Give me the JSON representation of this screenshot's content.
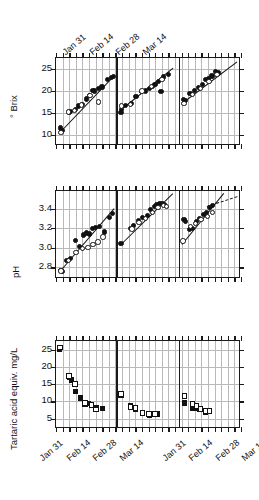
{
  "figure": {
    "width": 259,
    "height": 500,
    "background": "#ffffff",
    "axis_color": "#1a1a1a",
    "grid_color": "#b9b9b9",
    "marker_color": "#111111"
  },
  "chart_data": [
    {
      "id": "brix",
      "type": "scatter",
      "title": "",
      "ylabel": "° Brix",
      "xlabel": "",
      "ylim": [
        7.5,
        27.5
      ],
      "yticks": [
        10,
        15,
        20,
        25
      ],
      "yticklabels": [
        "10",
        "15",
        "20",
        "25"
      ],
      "grid": true,
      "legend": "",
      "xaxis_labels_position": "top",
      "xticklabels": [
        "Jan 31",
        "Feb 14",
        "Feb 28",
        "Mar 14"
      ],
      "xtick_label_values": [
        31,
        45,
        59,
        73
      ],
      "xlim": [
        24,
        122
      ],
      "panels": [
        {
          "name": "panel-1",
          "xrange": [
            24,
            56
          ],
          "trendline": {
            "x1": 26,
            "y1": 10.6,
            "x2": 55,
            "y2": 23.6,
            "style": "solid"
          },
          "series": [
            {
              "name": "filled-circle",
              "marker": "filled-circle",
              "x": [
                26.4,
                27.2,
                31.0,
                31.8,
                34.4,
                36.0,
                38.0,
                40.2,
                41.6,
                43.6,
                44.6,
                46.6,
                48.4,
                51.4,
                53.4,
                54.6
              ],
              "y": [
                11.6,
                11.0,
                15.1,
                15.4,
                15.8,
                16.6,
                17.0,
                18.2,
                18.9,
                20.2,
                20.0,
                20.6,
                20.9,
                22.6,
                23.0,
                23.3
              ]
            },
            {
              "name": "open-circle",
              "marker": "open-circle",
              "x": [
                26.6,
                30.6,
                33.8,
                37.6,
                42.0,
                46.6
              ],
              "y": [
                10.6,
                15.2,
                15.6,
                16.8,
                19.0,
                17.5
              ]
            }
          ]
        },
        {
          "name": "panel-2",
          "xrange": [
            56,
            89
          ],
          "trendline": {
            "x1": 58,
            "y1": 15.6,
            "x2": 86,
            "y2": 25.2,
            "style": "solid"
          },
          "series": [
            {
              "name": "filled-circle",
              "marker": "filled-circle",
              "x": [
                58.4,
                58.8,
                61.0,
                64.0,
                66.4,
                69.2,
                71.4,
                73.4,
                75.0,
                76.4,
                78.2,
                79.6,
                81.0,
                83.4
              ],
              "y": [
                15.2,
                15.8,
                16.7,
                17.2,
                18.8,
                19.8,
                20.0,
                20.6,
                21.1,
                21.5,
                22.1,
                19.8,
                23.2,
                23.8
              ]
            },
            {
              "name": "open-circle",
              "marker": "open-circle",
              "x": [
                58.6,
                63.6,
                69.6,
                74.6,
                80.2
              ],
              "y": [
                16.6,
                17.0,
                20.0,
                21.0,
                22.6
              ]
            }
          ]
        },
        {
          "name": "panel-3",
          "xrange": [
            89,
            122
          ],
          "trendline": {
            "x1": 91,
            "y1": 17.2,
            "x2": 120,
            "y2": 26.6,
            "style": "solid"
          },
          "series": [
            {
              "name": "filled-circle",
              "marker": "filled-circle",
              "x": [
                91.4,
                92.6,
                95.0,
                97.2,
                99.4,
                101.4,
                103.0,
                104.8,
                106.6,
                108.4,
                110.0
              ],
              "y": [
                18.0,
                17.9,
                19.4,
                20.2,
                20.8,
                21.5,
                22.6,
                22.8,
                23.4,
                24.4,
                24.1
              ]
            },
            {
              "name": "open-circle",
              "marker": "open-circle",
              "x": [
                91.8,
                96.4,
                100.6,
                105.0,
                109.2
              ],
              "y": [
                17.2,
                19.2,
                20.6,
                22.2,
                23.8
              ]
            }
          ]
        }
      ]
    },
    {
      "id": "ph",
      "type": "scatter",
      "title": "",
      "ylabel": "pH",
      "xlabel": "",
      "ylim": [
        2.68,
        3.58
      ],
      "yticks": [
        2.8,
        3.0,
        3.2,
        3.4
      ],
      "yticklabels": [
        "2.8",
        "3.0",
        "3.2",
        "3.4"
      ],
      "grid": true,
      "legend": "",
      "xaxis_labels_position": "none",
      "xticklabels": [],
      "xlim": [
        24,
        122
      ],
      "panels": [
        {
          "name": "panel-1",
          "xrange": [
            24,
            56
          ],
          "trendline": {
            "x1": 26,
            "y1": 2.76,
            "x2": 54.5,
            "y2": 3.4,
            "style": "solid"
          },
          "series": [
            {
              "name": "filled-circle",
              "marker": "filled-circle",
              "x": [
                26.2,
                27.4,
                29.6,
                31.6,
                34.4,
                36.6,
                38.6,
                40.2,
                41.8,
                43.4,
                45.0,
                47.2,
                49.6,
                52.2,
                53.8
              ],
              "y": [
                2.77,
                2.76,
                2.87,
                2.89,
                3.07,
                3.01,
                3.13,
                3.15,
                3.14,
                3.2,
                3.21,
                3.22,
                3.16,
                3.31,
                3.35
              ]
            },
            {
              "name": "open-circle",
              "marker": "open-circle",
              "x": [
                26.6,
                30.6,
                34.6,
                38.0,
                41.0,
                43.6,
                46.2,
                49.0
              ],
              "y": [
                2.76,
                2.87,
                2.95,
                2.99,
                3.0,
                3.03,
                3.06,
                3.11
              ]
            }
          ]
        },
        {
          "name": "panel-2",
          "xrange": [
            56,
            89
          ],
          "trendline": {
            "x1": 58,
            "y1": 3.03,
            "x2": 86,
            "y2": 3.56,
            "style": "solid"
          },
          "series": [
            {
              "name": "filled-circle",
              "marker": "filled-circle",
              "x": [
                58.4,
                63.4,
                65.2,
                67.6,
                70.0,
                72.4,
                74.2,
                76.0,
                77.4,
                78.8,
                80.2,
                81.6
              ],
              "y": [
                3.04,
                3.2,
                3.23,
                3.28,
                3.31,
                3.33,
                3.39,
                3.42,
                3.44,
                3.45,
                3.45,
                3.44
              ]
            },
            {
              "name": "open-circle",
              "marker": "open-circle",
              "x": [
                64.2,
                68.0,
                71.4,
                75.0,
                78.0,
                80.8,
                82.6
              ],
              "y": [
                3.19,
                3.26,
                3.3,
                3.36,
                3.41,
                3.43,
                3.42
              ]
            }
          ]
        },
        {
          "name": "panel-3",
          "xrange": [
            89,
            122
          ],
          "trendline": {
            "x1": 91,
            "y1": 3.04,
            "x2": 113,
            "y2": 3.56,
            "style": "solid"
          },
          "trendline2": {
            "x1": 104,
            "y1": 3.43,
            "x2": 120,
            "y2": 3.53,
            "style": "dashed"
          },
          "series": [
            {
              "name": "filled-circle",
              "marker": "filled-circle",
              "x": [
                91.8,
                92.6,
                94.6,
                96.2,
                98.4,
                100.2,
                102.0,
                103.6,
                105.2,
                107.0
              ],
              "y": [
                3.29,
                3.27,
                3.19,
                3.2,
                3.27,
                3.3,
                3.34,
                3.36,
                3.41,
                3.43
              ]
            },
            {
              "name": "open-circle",
              "marker": "open-circle",
              "x": [
                91.2,
                95.4,
                97.8,
                100.8,
                104.2,
                106.8
              ],
              "y": [
                3.07,
                3.22,
                3.25,
                3.29,
                3.32,
                3.36
              ]
            }
          ]
        }
      ]
    },
    {
      "id": "tartaric",
      "type": "scatter",
      "title": "",
      "ylabel": "Tartaric acid equiv. mg/L",
      "xlabel": "",
      "ylim": [
        2.0,
        27.5
      ],
      "yticks": [
        5,
        10,
        15,
        20,
        25
      ],
      "yticklabels": [
        "5",
        "10",
        "15",
        "20",
        "25"
      ],
      "grid": true,
      "legend": "",
      "xaxis_labels_position": "bottom",
      "xticklabels": [
        "Jan 31",
        "Feb 14",
        "Feb 28",
        "Mar 14",
        "Jan 31",
        "Feb 14",
        "Feb 28",
        "Mar 14"
      ],
      "xtick_label_values": [
        31,
        45,
        59,
        73,
        96,
        110,
        124,
        138
      ],
      "xlim": [
        24,
        122
      ],
      "panels": [
        {
          "name": "panel-1",
          "xrange": [
            24,
            56
          ],
          "series": [
            {
              "name": "filled-square",
              "marker": "filled-square",
              "x": [
                26.0,
                31.0,
                32.2,
                34.2,
                37.0,
                39.4,
                41.0,
                42.8,
                45.2,
                48.6
              ],
              "y": [
                25.0,
                17.0,
                16.2,
                12.8,
                11.0,
                9.2,
                9.4,
                8.8,
                8.2,
                7.9
              ]
            },
            {
              "name": "open-square",
              "marker": "open-square",
              "x": [
                26.0,
                31.0,
                34.0,
                39.4,
                42.8,
                45.2
              ],
              "y": [
                25.6,
                17.4,
                15.0,
                9.6,
                9.0,
                7.7
              ]
            }
          ]
        },
        {
          "name": "panel-2",
          "xrange": [
            56,
            89
          ],
          "series": [
            {
              "name": "filled-square",
              "marker": "filled-square",
              "x": [
                58.4,
                63.4,
                66.2,
                69.8,
                73.4,
                75.6,
                77.6
              ],
              "y": [
                11.7,
                8.7,
                7.6,
                6.6,
                6.1,
                6.3,
                6.3
              ]
            },
            {
              "name": "open-square",
              "marker": "open-square",
              "x": [
                58.4,
                63.4,
                66.2,
                69.8,
                73.4,
                76.4
              ],
              "y": [
                12.2,
                8.3,
                8.0,
                6.6,
                6.4,
                6.4
              ]
            }
          ]
        },
        {
          "name": "panel-3",
          "xrange": [
            89,
            122
          ],
          "series": [
            {
              "name": "filled-square",
              "marker": "filled-square",
              "x": [
                92.0,
                96.4,
                98.4,
                100.2,
                103.2,
                105.0
              ],
              "y": [
                9.5,
                8.0,
                8.0,
                7.6,
                6.8,
                7.0
              ]
            },
            {
              "name": "open-square",
              "marker": "open-square",
              "x": [
                92.0,
                96.4,
                98.4,
                100.6,
                103.2,
                105.4
              ],
              "y": [
                11.5,
                9.2,
                8.6,
                7.8,
                7.2,
                7.2
              ]
            }
          ]
        }
      ]
    }
  ]
}
